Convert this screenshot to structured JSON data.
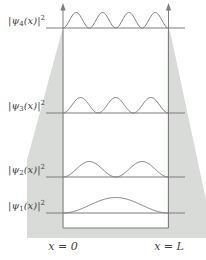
{
  "figure": {
    "levels": [
      {
        "n": 4,
        "humps": 4,
        "label_pre": "|ψ",
        "label_sub": "4",
        "label_mid": "(x)|",
        "label_sup": "2"
      },
      {
        "n": 3,
        "humps": 3,
        "label_pre": "|ψ",
        "label_sub": "3",
        "label_mid": "(x)|",
        "label_sup": "2"
      },
      {
        "n": 2,
        "humps": 2,
        "label_pre": "|ψ",
        "label_sub": "2",
        "label_mid": "(x)|",
        "label_sup": "2"
      },
      {
        "n": 1,
        "humps": 1,
        "label_pre": "|ψ",
        "label_sub": "1",
        "label_mid": "(x)|",
        "label_sup": "2"
      }
    ],
    "x_axis": {
      "left_label": "x = 0",
      "right_label": "x = L"
    },
    "colors": {
      "backdrop": "#d8dbd8",
      "line": "#7d7d7d",
      "text": "#3f3f3f"
    }
  },
  "chart_data": {
    "type": "line",
    "x_range": [
      "0",
      "L"
    ],
    "series": [
      {
        "name": "|ψ4(x)|2",
        "function": "sin^2(4πx/L)",
        "humps": 4,
        "peak_height": "equal amplitude"
      },
      {
        "name": "|ψ3(x)|2",
        "function": "sin^2(3πx/L)",
        "humps": 3,
        "peak_height": "equal amplitude"
      },
      {
        "name": "|ψ2(x)|2",
        "function": "sin^2(2πx/L)",
        "humps": 2,
        "peak_height": "equal amplitude"
      },
      {
        "name": "|ψ1(x)|2",
        "function": "sin^2(πx/L)",
        "humps": 1,
        "peak_height": "equal amplitude"
      }
    ],
    "annotations": [
      "x = 0",
      "x = L"
    ],
    "legend": "none",
    "grid": false
  }
}
